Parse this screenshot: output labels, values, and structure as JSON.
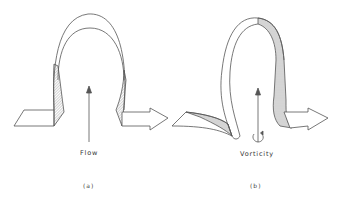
{
  "figure": {
    "panels": [
      {
        "id": "a",
        "caption": "(a)",
        "annotation": "Flow",
        "description": "Omega-shaped ribbon loop with flat tails left and arrow right; upward arrow indicating flow"
      },
      {
        "id": "b",
        "caption": "(b)",
        "annotation": "Vorticity",
        "description": "Twisted omega-shaped ribbon loop with hatched underside; upward arrow with circular rotation indicating vorticity"
      }
    ],
    "colors": {
      "line": "#555555",
      "background": "#ffffff"
    }
  }
}
